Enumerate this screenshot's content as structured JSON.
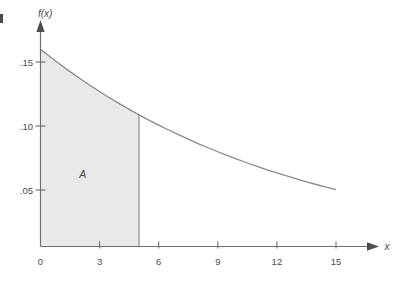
{
  "figure": {
    "name": "exponential-density-curve-with-shaded-area",
    "background_color": "#ffffff",
    "axis_color": "#6e6e6e",
    "curve_color": "#8a8a8a",
    "fill_color": "#e9e9e9",
    "text_color": "#4d4d4d"
  },
  "labels": {
    "y_axis_title": "f(x)",
    "x_axis_title": "x",
    "region_label": "A"
  },
  "chart_data": {
    "type": "area",
    "title": "",
    "subtitle": "",
    "xlabel": "x",
    "ylabel": "f(x)",
    "xlim": [
      0,
      15.8
    ],
    "ylim": [
      0,
      0.168
    ],
    "grid": false,
    "legend": null,
    "x_ticks": [
      0,
      3,
      6,
      9,
      12,
      15
    ],
    "x_tick_labels": [
      "0",
      "3",
      "6",
      "9",
      "12",
      "15"
    ],
    "y_ticks": [
      0.05,
      0.1,
      0.15
    ],
    "y_tick_labels": [
      ".05",
      ".10",
      ".15"
    ],
    "curve_function": "f(x) = 0.16 * e^(-0.0775x)",
    "x": [
      0,
      0.5,
      1,
      1.5,
      2,
      2.5,
      3,
      3.5,
      4,
      4.5,
      5,
      5.5,
      6,
      6.5,
      7,
      7.5,
      8,
      8.5,
      9,
      9.5,
      10,
      10.5,
      11,
      11.5,
      12,
      12.5,
      13,
      13.5,
      14,
      14.5,
      15
    ],
    "y": [
      0.16,
      0.1539,
      0.1481,
      0.1425,
      0.1371,
      0.1319,
      0.1269,
      0.1221,
      0.1175,
      0.113,
      0.1087,
      0.1046,
      0.1007,
      0.0969,
      0.0932,
      0.0897,
      0.0863,
      0.083,
      0.0799,
      0.0769,
      0.0739,
      0.0711,
      0.0684,
      0.0658,
      0.0634,
      0.061,
      0.0586,
      0.0564,
      0.0543,
      0.0522,
      0.0502
    ],
    "annotations": [
      {
        "label": "A",
        "type": "shaded-region",
        "description": "area under the curve from x = 0 to x = 5",
        "x_start": 0,
        "x_end": 5,
        "label_x": 2.15,
        "label_y": 0.0595
      }
    ]
  }
}
